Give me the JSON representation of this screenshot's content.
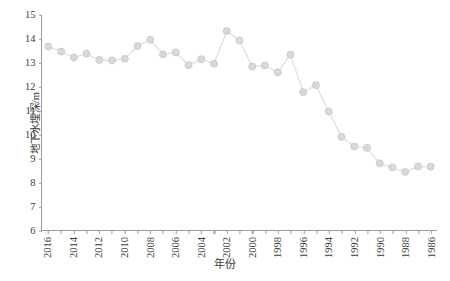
{
  "chart_data": {
    "type": "line",
    "title": "",
    "subtitle": "",
    "xlabel": "年份",
    "ylabel": "地下水埋深/m",
    "x_order": "descending",
    "xlim": [
      2016.5,
      1985.5
    ],
    "ylim": [
      6,
      15
    ],
    "y_ticks": [
      15,
      14,
      13,
      12,
      11,
      10,
      9,
      8,
      7,
      6
    ],
    "x_ticks_labeled": [
      2016,
      2014,
      2012,
      2010,
      2008,
      2006,
      2004,
      2002,
      2000,
      1998,
      1996,
      1994,
      1992,
      1990,
      1988,
      1986
    ],
    "x_tick_step": 1,
    "grid": false,
    "legend": null,
    "marker": "circle",
    "series": [
      {
        "name": "地下水埋深",
        "x": [
          2016,
          2015,
          2014,
          2013,
          2012,
          2011,
          2010,
          2009,
          2008,
          2007,
          2006,
          2005,
          2004,
          2003,
          2002,
          2001,
          2000,
          1999,
          1998,
          1997,
          1996,
          1995,
          1994,
          1993,
          1992,
          1991,
          1990,
          1989,
          1988,
          1987,
          1986
        ],
        "values": [
          13.68,
          13.47,
          13.22,
          13.38,
          13.12,
          13.1,
          13.17,
          13.7,
          13.96,
          13.35,
          13.43,
          12.9,
          13.15,
          12.96,
          14.33,
          13.93,
          12.84,
          12.89,
          12.6,
          13.34,
          11.77,
          12.06,
          10.96,
          9.9,
          9.5,
          9.44,
          8.79,
          8.62,
          8.43,
          8.66,
          8.65
        ]
      }
    ],
    "colors": {
      "marker_fill": "#d9d9d9",
      "marker_edge": "#c8c8c8",
      "line": "#dcdcdc",
      "axis": "#9a9a9a",
      "text": "#3a3a3a"
    }
  }
}
